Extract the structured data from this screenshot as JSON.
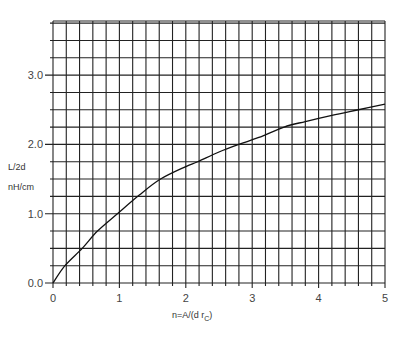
{
  "chart_data": {
    "type": "line",
    "title": "",
    "xlabel": "n=A/(d r",
    "xlabel_subscript": "C",
    "xlabel_suffix": ")",
    "ylabel_line1": "L/2d",
    "ylabel_line2": "nH/cm",
    "xlim": [
      0,
      5
    ],
    "ylim": [
      0,
      3.78
    ],
    "x_ticks": [
      0,
      1,
      2,
      3,
      4,
      5
    ],
    "x_tick_labels": [
      "0",
      "1",
      "2",
      "3",
      "4",
      "5"
    ],
    "y_ticks": [
      0,
      1,
      2,
      3
    ],
    "y_tick_labels": [
      "0.0",
      "1.0",
      "2.0",
      "3.0"
    ],
    "x_minor_step": 0.2,
    "y_minor_step": 0.25,
    "grid": true,
    "legend": null,
    "series": [
      {
        "name": "L/2d",
        "x": [
          0.0,
          0.18,
          0.44,
          0.67,
          0.97,
          1.3,
          1.62,
          2.0,
          2.18,
          2.5,
          2.8,
          3.1,
          3.48,
          3.8,
          4.2,
          4.6,
          5.0
        ],
        "y": [
          0.0,
          0.25,
          0.5,
          0.75,
          1.0,
          1.27,
          1.5,
          1.68,
          1.75,
          1.89,
          2.0,
          2.1,
          2.25,
          2.33,
          2.42,
          2.5,
          2.58
        ]
      }
    ]
  },
  "colors": {
    "grid": "#222222",
    "curve": "#111111",
    "text": "#444444",
    "background": "#ffffff"
  }
}
